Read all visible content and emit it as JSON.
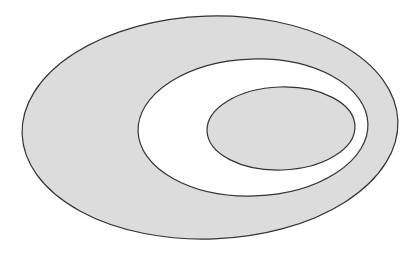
{
  "canvas": {
    "width": 419,
    "height": 253,
    "background_color": "#FFFFFF",
    "title": "Three concentric nested ellipses",
    "description": "A large filled gray ellipse containing a white ellipse, which in turn contains a smaller gray ellipse, producing alternating gray and white bands."
  },
  "style": {
    "fill_gray": "#DCDCDC",
    "fill_white": "#FFFFFF",
    "stroke_color": "#333333",
    "stroke_width": 1.2
  },
  "chart_data": {
    "type": "diagram",
    "shape_count": 3,
    "shapes": [
      {
        "name": "outer-ellipse",
        "order": 1,
        "fill": "#DCDCDC",
        "stroke": "#333333",
        "cx": 210,
        "cy": 127.5,
        "rx": 188,
        "ry": 111.5,
        "rotation_deg": -2,
        "left": 22,
        "right": 398,
        "top": 16,
        "bottom": 239
      },
      {
        "name": "middle-ellipse",
        "order": 2,
        "fill": "#FFFFFF",
        "stroke": "#333333",
        "cx": 253,
        "cy": 127.5,
        "rx": 115,
        "ry": 68.5,
        "rotation_deg": -2,
        "left": 138,
        "right": 368,
        "top": 59,
        "bottom": 196
      },
      {
        "name": "inner-ellipse",
        "order": 3,
        "fill": "#DCDCDC",
        "stroke": "#333333",
        "cx": 281,
        "cy": 128.5,
        "rx": 74,
        "ry": 41.5,
        "rotation_deg": -2,
        "left": 207,
        "right": 355,
        "top": 87,
        "bottom": 170
      }
    ],
    "regions": [
      {
        "name": "outer-gray-band",
        "fill": "#DCDCDC"
      },
      {
        "name": "white-band",
        "fill": "#FFFFFF"
      },
      {
        "name": "inner-gray-core",
        "fill": "#DCDCDC"
      }
    ]
  }
}
